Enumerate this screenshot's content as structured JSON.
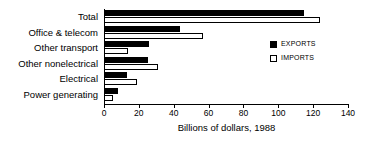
{
  "chart_data": {
    "type": "bar",
    "orientation": "horizontal",
    "title": "",
    "subtitle": "",
    "xlabel": "Billions of dollars, 1988",
    "ylabel": "",
    "xlim": [
      0,
      140
    ],
    "xticks": [
      0,
      20,
      40,
      60,
      80,
      100,
      120,
      140
    ],
    "xtick_labels": [
      "0",
      "20",
      "40",
      "60",
      "80",
      "100",
      "120",
      "140"
    ],
    "grid": false,
    "legend_position": "center-right",
    "categories": [
      "Total",
      "Office & telecom",
      "Other transport",
      "Other nonelectrical",
      "Electrical",
      "Power generating"
    ],
    "series": [
      {
        "name": "EXPORTS",
        "color": "#000000",
        "style": "filled",
        "values": [
          115,
          43.5,
          26,
          25,
          13,
          8
        ]
      },
      {
        "name": "IMPORTS",
        "color": "#ffffff",
        "style": "outlined",
        "values": [
          124,
          57,
          14,
          31,
          19,
          5
        ]
      }
    ]
  },
  "legend": {
    "items": [
      {
        "label": "EXPORTS",
        "swatch": "filled-black"
      },
      {
        "label": "IMPORTS",
        "swatch": "outlined-white"
      }
    ]
  },
  "colors": {
    "exports": "#000000",
    "imports": "#ffffff",
    "axis": "#000000",
    "background": "#ffffff"
  }
}
